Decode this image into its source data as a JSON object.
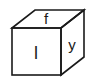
{
  "diagram": {
    "type": "cube-net-view",
    "stroke_color": "#1a1a1a",
    "background": "#ffffff",
    "faces": {
      "top": {
        "label": "f"
      },
      "front": {
        "label": "l"
      },
      "right": {
        "label": "y"
      }
    }
  }
}
